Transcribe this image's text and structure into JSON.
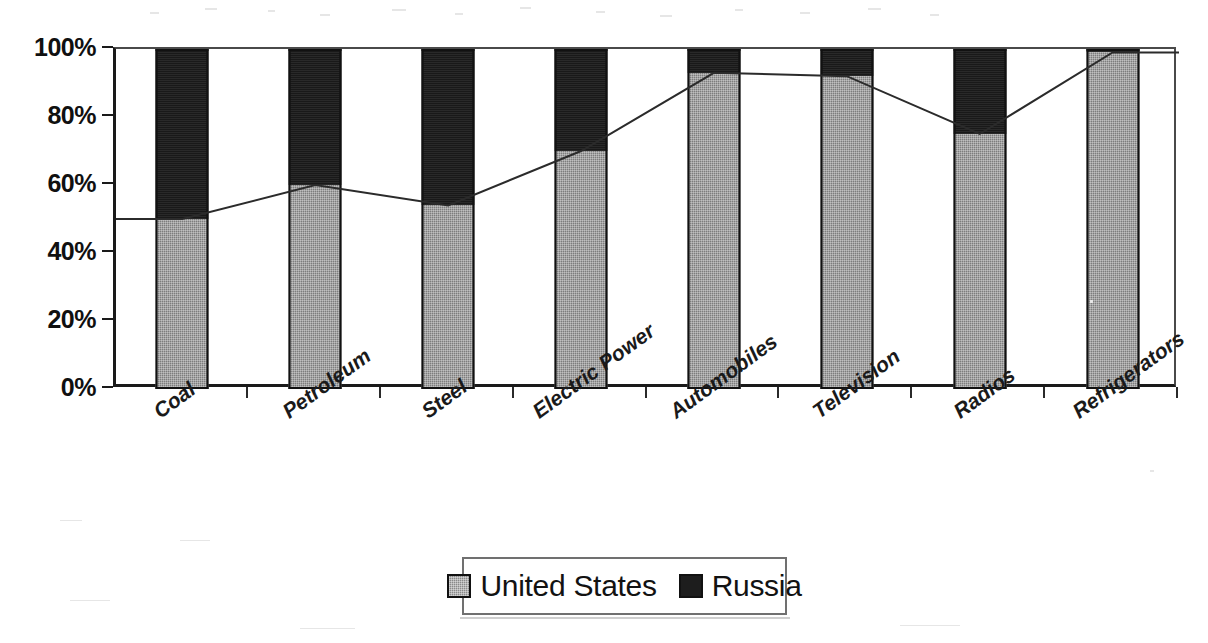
{
  "chart_data": {
    "type": "bar",
    "subtype": "stacked-percent-bar-with-line-overlay",
    "title": "",
    "xlabel": "",
    "ylabel": "",
    "ylim": [
      0,
      100
    ],
    "ytick_labels": [
      "100%",
      "80%",
      "60%",
      "40%",
      "20%",
      "0%"
    ],
    "ytick_values": [
      100,
      80,
      60,
      40,
      20,
      0
    ],
    "grid": false,
    "legend_position": "bottom-center",
    "categories": [
      "Coal",
      "Petroleum",
      "Steel",
      "Electric Power",
      "Automobiles",
      "Television",
      "Radios",
      "Refrigerators"
    ],
    "series": [
      {
        "name": "United States",
        "color": "#7d7d7d",
        "pattern": "dotted-gray",
        "values": [
          50,
          60,
          54,
          70,
          93,
          92,
          75,
          99
        ]
      },
      {
        "name": "Russia",
        "color": "#191919",
        "pattern": "solid-black",
        "values": [
          50,
          40,
          46,
          30,
          7,
          8,
          25,
          1
        ]
      }
    ],
    "overlay_line": {
      "name": "United States share trend",
      "style": "thin-dark-line",
      "values": [
        50,
        60,
        54,
        70,
        93,
        92,
        75,
        99
      ]
    }
  },
  "axes": {
    "y": {
      "ticks": [
        "100%",
        "80%",
        "60%",
        "40%",
        "20%",
        "0%"
      ]
    },
    "x": {
      "ticks": [
        "Coal",
        "Petroleum",
        "Steel",
        "Electric Power",
        "Automobiles",
        "Television",
        "Radios",
        "Refrigerators"
      ]
    }
  },
  "legend": {
    "items": [
      {
        "label": "United States",
        "swatch": "united-states-swatch"
      },
      {
        "label": "Russia",
        "swatch": "russia-swatch"
      }
    ]
  },
  "title_strip": {
    "ghost_text": ""
  },
  "colors": {
    "united_states": "#7d7d7d",
    "russia": "#191919",
    "axis": "#1a1a1a",
    "background": "#ffffff"
  }
}
